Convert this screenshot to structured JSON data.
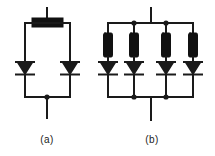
{
  "figure": {
    "kind": "electrical-schematic",
    "background_color": "#ffffff",
    "line_color": "#1a1a1a",
    "fill_color": "#111111",
    "stroke_width": 2,
    "thin_stroke_width": 1.6
  },
  "captions": [
    {
      "id": "caption-a",
      "label": "(a)",
      "x": 47,
      "y": 143
    },
    {
      "id": "caption-b",
      "label": "(b)",
      "x": 152,
      "y": 143
    }
  ],
  "circuit_a": {
    "name": "two-diode-series-resistor-network",
    "top_terminal": {
      "x": 47,
      "y_top": 8,
      "y_bottom": 18
    },
    "resistor": {
      "orientation": "horizontal",
      "x": 32,
      "y": 18,
      "width": 31,
      "height": 9,
      "style": "filled-block"
    },
    "top_rail": {
      "x1": 25,
      "x2": 70,
      "y": 23
    },
    "left_branch_x": 25,
    "right_branch_x": 70,
    "bottom_rail": {
      "x1": 25,
      "x2": 70,
      "y": 97
    },
    "bottom_terminal": {
      "x": 47,
      "y_top": 97,
      "y_bottom": 118
    },
    "junction_dots": [
      {
        "x": 47,
        "y": 97,
        "r": 2.6
      }
    ],
    "diodes": [
      {
        "id": "diode-a-left",
        "x": 25,
        "y_body": 68,
        "size": 11,
        "direction": "down"
      },
      {
        "id": "diode-a-right",
        "x": 70,
        "y_body": 68,
        "size": 11,
        "direction": "down"
      }
    ]
  },
  "circuit_b": {
    "name": "four-branch-ballast-resistor-diode-array",
    "top_terminal": {
      "x": 151,
      "y_top": 8,
      "y_bottom": 23
    },
    "top_rail": {
      "x1": 108,
      "x2": 193,
      "y": 23
    },
    "bottom_rail": {
      "x1": 108,
      "x2": 193,
      "y": 97
    },
    "bottom_terminal": {
      "x": 151,
      "y_top": 97,
      "y_bottom": 120
    },
    "branch_x": [
      108,
      134,
      166,
      193
    ],
    "resistor": {
      "orientation": "vertical",
      "width": 9,
      "y": 33,
      "height": 24,
      "style": "filled-block"
    },
    "diodes": [
      {
        "id": "diode-b-1",
        "x": 108,
        "y_body": 68,
        "size": 11,
        "direction": "down"
      },
      {
        "id": "diode-b-2",
        "x": 134,
        "y_body": 68,
        "size": 11,
        "direction": "down"
      },
      {
        "id": "diode-b-3",
        "x": 166,
        "y_body": 68,
        "size": 11,
        "direction": "down"
      },
      {
        "id": "diode-b-4",
        "x": 193,
        "y_body": 68,
        "size": 11,
        "direction": "down"
      }
    ],
    "junction_dots_top": [
      {
        "x": 134,
        "y": 23,
        "r": 2.6
      },
      {
        "x": 166,
        "y": 23,
        "r": 2.6
      }
    ],
    "junction_dots_bottom": [
      {
        "x": 134,
        "y": 97,
        "r": 2.6
      },
      {
        "x": 166,
        "y": 97,
        "r": 2.6
      }
    ]
  }
}
